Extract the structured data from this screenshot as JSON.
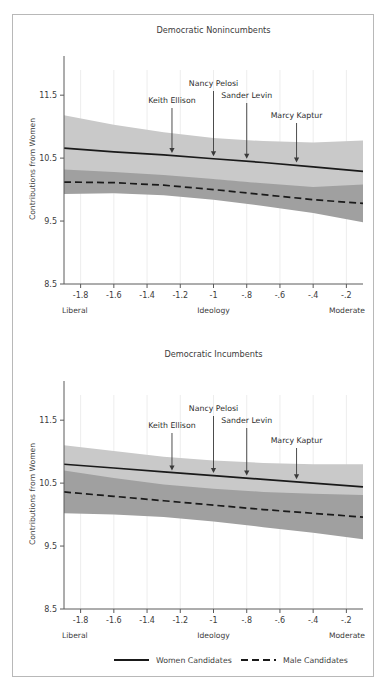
{
  "figure": {
    "background": "#ffffff",
    "border_color": "#b8b8b8",
    "width": 388,
    "height": 688
  },
  "legend": {
    "women_label": "Women Candidates",
    "male_label": "Male Candidates",
    "women_style": "solid",
    "male_style": "dashed",
    "line_color": "#1a1a1a"
  },
  "colors": {
    "women_band": "#c9c9c9",
    "male_band": "#a0a0a0",
    "line": "#1a1a1a",
    "axis": "#5a5a5a",
    "text": "#3c3c3c",
    "grid": "#ededed"
  },
  "chart_data": [
    {
      "type": "line",
      "title": "Democratic Nonincumbents",
      "xlabel": "Ideology",
      "ylabel": "Contributions from Women",
      "xlim": [
        -1.9,
        -0.1
      ],
      "ylim": [
        8.5,
        11.9
      ],
      "xticks": [
        -1.8,
        -1.6,
        -1.4,
        -1.2,
        -1,
        -0.8,
        -0.6,
        -0.4,
        -0.2
      ],
      "xticklabels": [
        "-1.8",
        "-1.6",
        "-1.4",
        "-1.2",
        "-1",
        "-.8",
        "-.6",
        "-.4",
        "-.2"
      ],
      "yticks": [
        8.5,
        9.5,
        10.5,
        11.5
      ],
      "yticklabels": [
        "8.5",
        "9.5",
        "10.5",
        "11.5"
      ],
      "x_axis_left_end_label": "Liberal",
      "x_axis_right_end_label": "Moderate",
      "grid": false,
      "legend_position": "below-figure",
      "x": [
        -1.9,
        -1.6,
        -1.3,
        -1.0,
        -0.7,
        -0.4,
        -0.1
      ],
      "series": [
        {
          "name": "Women Candidates",
          "style": "solid",
          "values": [
            10.66,
            10.6,
            10.55,
            10.49,
            10.43,
            10.36,
            10.29
          ],
          "ci_lower": [
            10.13,
            10.18,
            10.19,
            10.16,
            10.09,
            9.97,
            9.8
          ],
          "ci_upper": [
            11.18,
            11.03,
            10.91,
            10.82,
            10.77,
            10.75,
            10.78
          ],
          "band_color": "#c9c9c9"
        },
        {
          "name": "Male Candidates",
          "style": "dashed",
          "values": [
            10.12,
            10.11,
            10.07,
            10.0,
            9.92,
            9.84,
            9.78
          ],
          "ci_lower": [
            9.93,
            9.94,
            9.91,
            9.84,
            9.74,
            9.63,
            9.48
          ],
          "ci_upper": [
            10.32,
            10.28,
            10.23,
            10.17,
            10.1,
            10.04,
            10.08
          ],
          "band_color": "#a0a0a0"
        }
      ],
      "annotations": [
        {
          "label": "Keith Ellison",
          "x": -1.25,
          "y": 10.54
        },
        {
          "label": "Nancy Pelosi",
          "x": -1.0,
          "y": 10.49
        },
        {
          "label": "Sander Levin",
          "x": -0.8,
          "y": 10.45
        },
        {
          "label": "Marcy Kaptur",
          "x": -0.5,
          "y": 10.39
        }
      ]
    },
    {
      "type": "line",
      "title": "Democratic Incumbents",
      "xlabel": "Ideology",
      "ylabel": "Contributions from Women",
      "xlim": [
        -1.9,
        -0.1
      ],
      "ylim": [
        8.5,
        11.9
      ],
      "xticks": [
        -1.8,
        -1.6,
        -1.4,
        -1.2,
        -1,
        -0.8,
        -0.6,
        -0.4,
        -0.2
      ],
      "xticklabels": [
        "-1.8",
        "-1.6",
        "-1.4",
        "-1.2",
        "-1",
        "-.8",
        "-.6",
        "-.4",
        "-.2"
      ],
      "yticks": [
        8.5,
        9.5,
        10.5,
        11.5
      ],
      "yticklabels": [
        "8.5",
        "9.5",
        "10.5",
        "11.5"
      ],
      "x_axis_left_end_label": "Liberal",
      "x_axis_right_end_label": "Moderate",
      "grid": false,
      "legend_position": "below-figure",
      "x": [
        -1.9,
        -1.6,
        -1.3,
        -1.0,
        -0.7,
        -0.4,
        -0.1
      ],
      "series": [
        {
          "name": "Women Candidates",
          "style": "solid",
          "values": [
            10.8,
            10.74,
            10.68,
            10.62,
            10.56,
            10.5,
            10.44
          ],
          "ci_lower": [
            10.5,
            10.48,
            10.44,
            10.38,
            10.3,
            10.2,
            10.08
          ],
          "ci_upper": [
            11.1,
            11.01,
            10.92,
            10.86,
            10.82,
            10.8,
            10.8
          ],
          "band_color": "#c9c9c9"
        },
        {
          "name": "Male Candidates",
          "style": "dashed",
          "values": [
            10.36,
            10.29,
            10.22,
            10.15,
            10.08,
            10.02,
            9.96
          ],
          "ci_lower": [
            10.02,
            10.0,
            9.96,
            9.89,
            9.8,
            9.71,
            9.61
          ],
          "ci_upper": [
            10.7,
            10.58,
            10.48,
            10.41,
            10.36,
            10.33,
            10.31
          ],
          "band_color": "#a0a0a0"
        }
      ],
      "annotations": [
        {
          "label": "Keith Ellison",
          "x": -1.25,
          "y": 10.66
        },
        {
          "label": "Nancy Pelosi",
          "x": -1.0,
          "y": 10.62
        },
        {
          "label": "Sander Levin",
          "x": -0.8,
          "y": 10.58
        },
        {
          "label": "Marcy Kaptur",
          "x": -0.5,
          "y": 10.52
        }
      ]
    }
  ]
}
